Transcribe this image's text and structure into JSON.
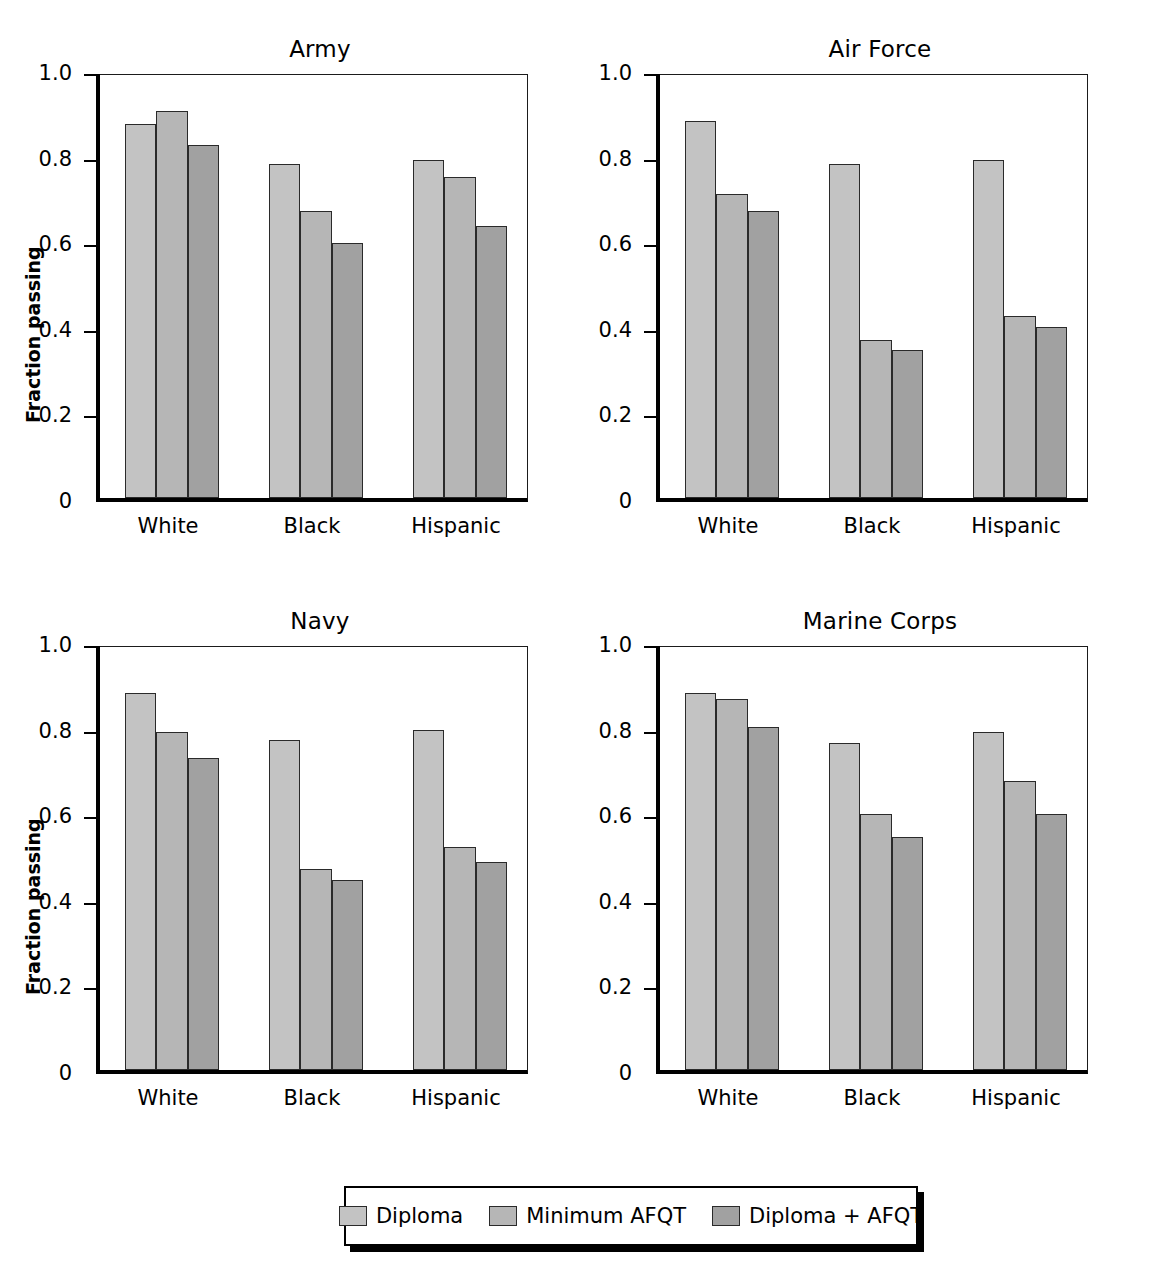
{
  "figure": {
    "background": "#ffffff",
    "series_colors": [
      "#c3c3c3",
      "#b6b6b6",
      "#a1a1a1"
    ],
    "bar_edge_color": "#2a2a2a",
    "axis_color": "#000000"
  },
  "legend": {
    "entries": [
      {
        "label": "Diploma",
        "color": "#c3c3c3"
      },
      {
        "label": "Minimum AFQT",
        "color": "#b6b6b6"
      },
      {
        "label": "Diploma + AFQT",
        "color": "#a1a1a1"
      }
    ]
  },
  "axis": {
    "ylabel": "Fraction passing",
    "ytick_labels": [
      "1.0",
      "0.8",
      "0.6",
      "0.4",
      "0.2",
      "0"
    ],
    "ytick_values": [
      1.0,
      0.8,
      0.6,
      0.4,
      0.2,
      0.0
    ],
    "xtick_labels": [
      "White",
      "Black",
      "Hispanic"
    ],
    "ylim": [
      0,
      1.0
    ]
  },
  "chart_data": {
    "type": "bar",
    "title": "",
    "xlabel": "",
    "ylabel": "Fraction passing",
    "ylim": [
      0,
      1.0
    ],
    "grid": false,
    "legend_position": "bottom-center",
    "categories": [
      "White",
      "Black",
      "Hispanic"
    ],
    "series_names": [
      "Diploma",
      "Minimum AFQT",
      "Diploma + AFQT"
    ],
    "panels": [
      {
        "title": "Army",
        "show_ylabel": true,
        "series": [
          {
            "name": "Diploma",
            "values": [
              0.875,
              0.78,
              0.79
            ]
          },
          {
            "name": "Minimum AFQT",
            "values": [
              0.905,
              0.67,
              0.75
            ]
          },
          {
            "name": "Diploma + AFQT",
            "values": [
              0.825,
              0.595,
              0.635
            ]
          }
        ]
      },
      {
        "title": "Air Force",
        "show_ylabel": false,
        "series": [
          {
            "name": "Diploma",
            "values": [
              0.88,
              0.78,
              0.79
            ]
          },
          {
            "name": "Minimum AFQT",
            "values": [
              0.71,
              0.37,
              0.425
            ]
          },
          {
            "name": "Diploma + AFQT",
            "values": [
              0.67,
              0.345,
              0.4
            ]
          }
        ]
      },
      {
        "title": "Navy",
        "show_ylabel": true,
        "series": [
          {
            "name": "Diploma",
            "values": [
              0.88,
              0.77,
              0.795
            ]
          },
          {
            "name": "Minimum AFQT",
            "values": [
              0.79,
              0.47,
              0.52
            ]
          },
          {
            "name": "Diploma + AFQT",
            "values": [
              0.73,
              0.445,
              0.485
            ]
          }
        ]
      },
      {
        "title": "Marine Corps",
        "show_ylabel": true,
        "series": [
          {
            "name": "Diploma",
            "values": [
              0.88,
              0.765,
              0.79
            ]
          },
          {
            "name": "Minimum AFQT",
            "values": [
              0.868,
              0.598,
              0.675
            ]
          },
          {
            "name": "Diploma + AFQT",
            "values": [
              0.802,
              0.545,
              0.598
            ]
          }
        ]
      }
    ]
  }
}
